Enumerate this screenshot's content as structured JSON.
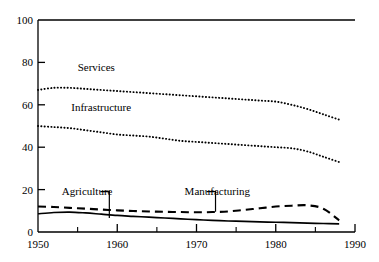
{
  "chart_data": {
    "type": "line",
    "title": "",
    "xlabel": "",
    "ylabel": "",
    "xlim": [
      1950,
      1990
    ],
    "ylim": [
      0,
      100
    ],
    "grid": false,
    "legend_position": "inline-annotations",
    "x_ticks": [
      1950,
      1960,
      1970,
      1980,
      1990
    ],
    "x_minor_ticks": [
      1955,
      1965,
      1975,
      1985
    ],
    "y_ticks": [
      0,
      20,
      40,
      60,
      80,
      100
    ],
    "x_tick_labels": [
      "1950",
      "1960",
      "1970",
      "1980",
      "1990"
    ],
    "y_tick_labels": [
      "0",
      "20",
      "40",
      "60",
      "80",
      "100"
    ],
    "x": [
      1950,
      1952,
      1954,
      1956,
      1958,
      1960,
      1962,
      1964,
      1966,
      1968,
      1970,
      1972,
      1974,
      1976,
      1978,
      1980,
      1982,
      1984,
      1986,
      1988
    ],
    "series": [
      {
        "name": "Services",
        "style": "dotted",
        "label": "Services",
        "label_x": 1955.0,
        "label_y": 76,
        "values": [
          67.0,
          68.0,
          68.0,
          67.5,
          67.0,
          66.5,
          66.0,
          65.5,
          65.0,
          64.5,
          64.0,
          63.5,
          63.0,
          62.5,
          62.0,
          61.5,
          60.0,
          58.0,
          55.5,
          53.0
        ]
      },
      {
        "name": "Infrastructure",
        "style": "dotted",
        "label": "Infrastructure",
        "label_x": 1954.2,
        "label_y": 57,
        "values": [
          50.0,
          49.5,
          49.0,
          48.0,
          47.0,
          46.0,
          45.5,
          45.0,
          44.0,
          43.0,
          42.5,
          42.0,
          41.5,
          41.0,
          40.5,
          40.0,
          39.5,
          38.0,
          35.5,
          33.0
        ]
      },
      {
        "name": "Manufacturing",
        "style": "dashed",
        "label": "Manufacturing",
        "label_x": 1968.5,
        "label_y": 17.5,
        "leader_from_x": 1972.4,
        "leader_from_y": 16.0,
        "leader_to_x": 1972.4,
        "leader_to_y": 9.6,
        "values": [
          12.0,
          11.8,
          11.4,
          11.0,
          10.6,
          10.2,
          9.9,
          9.7,
          9.5,
          9.4,
          9.3,
          9.4,
          9.7,
          10.4,
          11.2,
          12.0,
          12.4,
          12.6,
          11.0,
          5.5
        ]
      },
      {
        "name": "Agriculture",
        "style": "solid",
        "label": "Agriculture",
        "label_x": 1953.0,
        "label_y": 17.5,
        "leader_from_x": 1959.0,
        "leader_from_y": 16.0,
        "leader_to_x": 1959.0,
        "leader_to_y": 6.6,
        "values": [
          8.6,
          9.2,
          9.4,
          9.0,
          8.4,
          7.8,
          7.4,
          7.0,
          6.6,
          6.2,
          5.8,
          5.5,
          5.2,
          5.0,
          4.8,
          4.6,
          4.4,
          4.2,
          4.0,
          3.8
        ]
      }
    ],
    "colors": {
      "axis": "#000000",
      "line": "#000000",
      "background": "#ffffff"
    }
  }
}
